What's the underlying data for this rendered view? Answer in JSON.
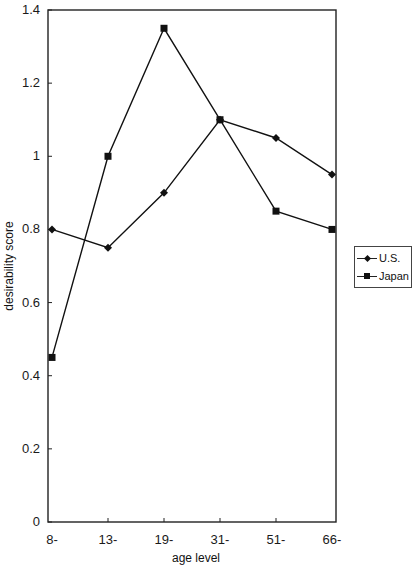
{
  "chart_data": {
    "type": "line",
    "title": "",
    "xlabel": "age level",
    "ylabel": "desirability score",
    "categories": [
      "8-",
      "13-",
      "19-",
      "31-",
      "51-",
      "66-"
    ],
    "ylim": [
      0,
      1.4
    ],
    "yticks": [
      "0",
      "0.2",
      "0.4",
      "0.6",
      "0.8",
      "1",
      "1.2",
      "1.4"
    ],
    "grid": false,
    "legend_position": "right",
    "series": [
      {
        "name": "U.S.",
        "marker": "diamond",
        "color": "#111111",
        "values": [
          0.8,
          0.75,
          0.9,
          1.1,
          1.05,
          0.95
        ]
      },
      {
        "name": "Japan",
        "marker": "square",
        "color": "#111111",
        "values": [
          0.45,
          1.0,
          1.35,
          1.1,
          0.85,
          0.8
        ]
      }
    ]
  },
  "legend": {
    "items": [
      "U.S.",
      "Japan"
    ]
  }
}
